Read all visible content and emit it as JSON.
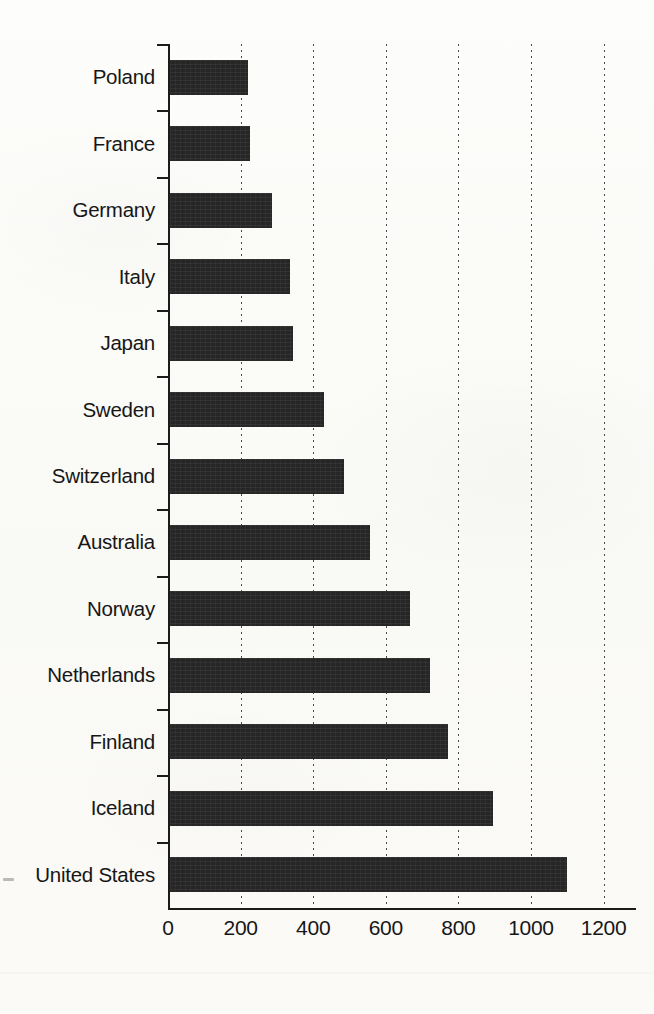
{
  "chart_data": {
    "type": "bar",
    "orientation": "horizontal",
    "title": "",
    "subtitle": "",
    "xlabel": "",
    "ylabel": "",
    "xlim": [
      0,
      1200
    ],
    "ylim": null,
    "grid": "vertical dotted gridlines at each x tick",
    "legend": null,
    "legend_position": "none",
    "bar_color": "#262626",
    "background_color": "#fbfbf9",
    "axis_color": "#1b1b1b",
    "xticks": [
      0,
      200,
      400,
      600,
      800,
      1000,
      1200
    ],
    "xtick_labels": [
      "0",
      "200",
      "400",
      "600",
      "800",
      "1000",
      "1200"
    ],
    "categories": [
      "Poland",
      "France",
      "Germany",
      "Italy",
      "Japan",
      "Sweden",
      "Switzerland",
      "Australia",
      "Norway",
      "Netherlands",
      "Finland",
      "Iceland",
      "United States"
    ],
    "values": [
      215,
      220,
      280,
      330,
      340,
      425,
      480,
      550,
      660,
      715,
      765,
      890,
      1095
    ],
    "series": [
      {
        "name": "value",
        "values": [
          215,
          220,
          280,
          330,
          340,
          425,
          480,
          550,
          660,
          715,
          765,
          890,
          1095
        ]
      }
    ],
    "annotations": []
  }
}
